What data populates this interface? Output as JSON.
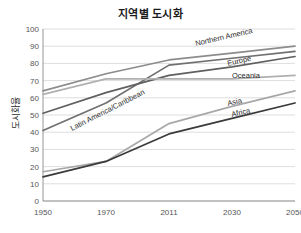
{
  "chart_data": {
    "type": "line",
    "title": "지역별 도시화",
    "xlabel": "",
    "ylabel": "도시화율",
    "x": [
      "1950",
      "1970",
      "2011",
      "2030",
      "2050"
    ],
    "xtick_labels": [
      "1950",
      "1970",
      "2011",
      "2030",
      "2050"
    ],
    "ytick_labels": [
      "0",
      "10",
      "20",
      "30",
      "40",
      "50",
      "60",
      "70",
      "80",
      "90",
      "100"
    ],
    "ylim": [
      0,
      100
    ],
    "ytick_step": 10,
    "grid": "horizontal",
    "legend_position": "inline-labels",
    "series": [
      {
        "name": "Northern America",
        "values": [
          64,
          74,
          82,
          86,
          90
        ],
        "color": "#8c8c8c"
      },
      {
        "name": "Latin America/Caribbean",
        "values": [
          41,
          57,
          79,
          83,
          87
        ],
        "color": "#707070"
      },
      {
        "name": "Europe",
        "values": [
          51,
          63,
          73,
          78,
          84
        ],
        "color": "#606060"
      },
      {
        "name": "Oceania",
        "values": [
          62,
          71,
          71,
          71,
          73
        ],
        "color": "#b0b0b0"
      },
      {
        "name": "Asia",
        "values": [
          17,
          23,
          45,
          55,
          64
        ],
        "color": "#a8a8a8"
      },
      {
        "name": "Africa",
        "values": [
          14,
          23,
          39,
          48,
          57
        ],
        "color": "#3a3a3a"
      }
    ],
    "annotations": [
      {
        "text": "Northern America",
        "x": 196,
        "y": 46,
        "rotate": -13
      },
      {
        "text": "Europe",
        "x": 228,
        "y": 66,
        "rotate": -13
      },
      {
        "text": "Oceania",
        "x": 232,
        "y": 78,
        "rotate": 0
      },
      {
        "text": "Latin America/Caribbean",
        "x": 72,
        "y": 131,
        "rotate": -27
      },
      {
        "text": "Asia",
        "x": 228,
        "y": 106,
        "rotate": -13
      },
      {
        "text": "Africa",
        "x": 232,
        "y": 117,
        "rotate": -13
      }
    ]
  },
  "colors": {
    "background": "#ffffff",
    "grid": "#c8c8c8",
    "axis": "#8a8a8a",
    "text": "#555555",
    "title": "#1a1a1a"
  }
}
